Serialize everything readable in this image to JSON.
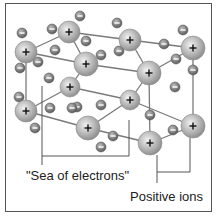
{
  "diagram": {
    "labels": {
      "sea_of_electrons": "\"Sea of electrons\"",
      "positive_ions": "Positive ions"
    },
    "ion_symbol": "+",
    "electron_symbol": "−",
    "colors": {
      "ion_fill": "#b8b8b8",
      "electron_fill": "#808080",
      "lines": "#7a7a7a",
      "border": "#555555",
      "text": "#222222"
    },
    "ions": [
      {
        "x": 69,
        "y": 32,
        "r": 11
      },
      {
        "x": 26,
        "y": 52,
        "r": 11
      },
      {
        "x": 130,
        "y": 40,
        "r": 11
      },
      {
        "x": 193,
        "y": 48,
        "r": 12
      },
      {
        "x": 86,
        "y": 64,
        "r": 12
      },
      {
        "x": 149,
        "y": 73,
        "r": 12
      },
      {
        "x": 70,
        "y": 87,
        "r": 10
      },
      {
        "x": 130,
        "y": 100,
        "r": 10
      },
      {
        "x": 26,
        "y": 111,
        "r": 11
      },
      {
        "x": 88,
        "y": 128,
        "r": 12
      },
      {
        "x": 193,
        "y": 126,
        "r": 12
      },
      {
        "x": 150,
        "y": 143,
        "r": 12
      }
    ],
    "electrons": [
      {
        "x": 80,
        "y": 16
      },
      {
        "x": 22,
        "y": 33
      },
      {
        "x": 52,
        "y": 29
      },
      {
        "x": 86,
        "y": 41
      },
      {
        "x": 55,
        "y": 50
      },
      {
        "x": 38,
        "y": 62
      },
      {
        "x": 20,
        "y": 68
      },
      {
        "x": 117,
        "y": 23
      },
      {
        "x": 119,
        "y": 51
      },
      {
        "x": 101,
        "y": 55
      },
      {
        "x": 164,
        "y": 44
      },
      {
        "x": 183,
        "y": 30
      },
      {
        "x": 176,
        "y": 59
      },
      {
        "x": 193,
        "y": 70
      },
      {
        "x": 49,
        "y": 78
      },
      {
        "x": 19,
        "y": 97
      },
      {
        "x": 50,
        "y": 108
      },
      {
        "x": 35,
        "y": 128
      },
      {
        "x": 77,
        "y": 107
      },
      {
        "x": 101,
        "y": 105
      },
      {
        "x": 175,
        "y": 87
      },
      {
        "x": 150,
        "y": 115
      },
      {
        "x": 113,
        "y": 136
      },
      {
        "x": 173,
        "y": 130
      },
      {
        "x": 101,
        "y": 147
      },
      {
        "x": 72,
        "y": 108
      }
    ],
    "bonds": [
      [
        0,
        1
      ],
      [
        0,
        2
      ],
      [
        0,
        4
      ],
      [
        1,
        4
      ],
      [
        1,
        8
      ],
      [
        2,
        3
      ],
      [
        2,
        5
      ],
      [
        3,
        5
      ],
      [
        3,
        10
      ],
      [
        4,
        5
      ],
      [
        4,
        6
      ],
      [
        5,
        7
      ],
      [
        6,
        8
      ],
      [
        6,
        7
      ],
      [
        7,
        9
      ],
      [
        7,
        10
      ],
      [
        8,
        9
      ],
      [
        9,
        11
      ],
      [
        10,
        11
      ],
      [
        5,
        11
      ]
    ]
  }
}
